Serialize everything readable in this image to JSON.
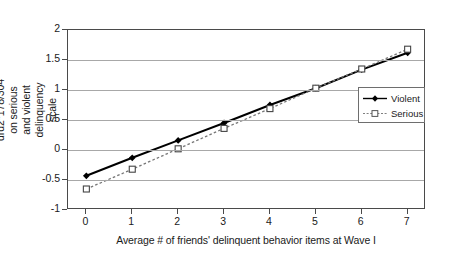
{
  "chart_data": {
    "type": "line",
    "title": "",
    "xlabel": "Average # of friends' delinquent behavior items at Wave I",
    "ylabel": "Effect of drd2*178/304 on serious and violent delinquency scale",
    "x": [
      0,
      1,
      2,
      3,
      4,
      5,
      6,
      7
    ],
    "xticklabels": [
      "0",
      "1",
      "2",
      "3",
      "4",
      "5",
      "6",
      "7"
    ],
    "yticklabels": [
      "2",
      "1.5",
      "1",
      "0.5",
      "0",
      "-0.5",
      "-1"
    ],
    "yticks": [
      2,
      1.5,
      1,
      0.5,
      0,
      -0.5,
      -1
    ],
    "xlim": [
      -0.4,
      7.4
    ],
    "ylim": [
      -1,
      2
    ],
    "grid": "horizontal",
    "legend_position": "right-middle",
    "series": [
      {
        "name": "Violent",
        "values": [
          -0.43,
          -0.13,
          0.16,
          0.45,
          0.75,
          1.03,
          1.34,
          1.62
        ],
        "line_style": "solid",
        "marker": "filled-diamond",
        "color": "#000000"
      },
      {
        "name": "Serious",
        "values": [
          -0.65,
          -0.32,
          0.02,
          0.36,
          0.69,
          1.03,
          1.35,
          1.68
        ],
        "line_style": "dotted",
        "marker": "open-square",
        "color": "#777777"
      }
    ]
  },
  "legend": {
    "items": [
      {
        "label": "Violent"
      },
      {
        "label": "Serious"
      }
    ]
  },
  "axes": {
    "y_title": "Effect of drd2*178/304 on serious and violent delinquency scale",
    "x_title": "Average # of friends' delinquent behavior items at Wave I"
  }
}
